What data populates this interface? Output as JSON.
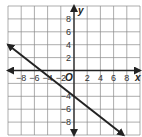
{
  "chart_data": {
    "type": "line",
    "title": "",
    "xlabel": "x",
    "ylabel": "y",
    "origin_label": "O",
    "xlim": [
      -10,
      10
    ],
    "ylim": [
      -10,
      10
    ],
    "grid": true,
    "grid_step": 2,
    "x_ticks": [
      "-8",
      "-6",
      "-4",
      "-2",
      "2",
      "4",
      "6",
      "8"
    ],
    "y_ticks": [
      "8",
      "6",
      "4",
      "2",
      "-4",
      "-6",
      "-8"
    ],
    "series": [
      {
        "name": "line",
        "x": [
          -10,
          7.5
        ],
        "y": [
          4,
          -10
        ],
        "slope": -0.8,
        "y_intercept": -4,
        "x_intercept": -5,
        "arrows_both_ends": true
      }
    ]
  },
  "colors": {
    "grid": "#8a8a8a",
    "axis": "#222222",
    "line": "#222222"
  }
}
